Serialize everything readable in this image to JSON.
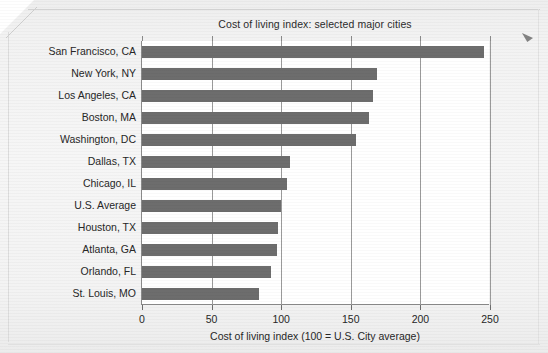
{
  "chart_data": {
    "type": "bar",
    "orientation": "horizontal",
    "title": "Cost of living index: selected major cities",
    "xlabel": "Cost of living index (100 = U.S. City average)",
    "ylabel": "",
    "xlim": [
      0,
      250
    ],
    "xticks": [
      0,
      50,
      100,
      150,
      200,
      250
    ],
    "xtick_labels": [
      "0",
      "50",
      "100",
      "150",
      "200",
      "250"
    ],
    "grid": "vertical",
    "legend": "none",
    "bar_color": "#6d6d6d",
    "categories": [
      "San Francisco, CA",
      "New York, NY",
      "Los Angeles, CA",
      "Boston, MA",
      "Washington, DC",
      "Dallas, TX",
      "Chicago, IL",
      "U.S. Average",
      "Houston, TX",
      "Atlanta, GA",
      "Orlando, FL",
      "St. Louis, MO"
    ],
    "values": [
      246,
      169,
      166,
      163,
      154,
      106,
      104,
      100,
      98,
      97,
      93,
      84
    ]
  },
  "axes": {
    "x_tick_labels": [
      "0",
      "50",
      "100",
      "150",
      "200",
      "250"
    ],
    "x_title": "Cost of living index (100 = U.S. City average)"
  },
  "figure": {
    "title": "Cost of living index: selected major cities"
  }
}
